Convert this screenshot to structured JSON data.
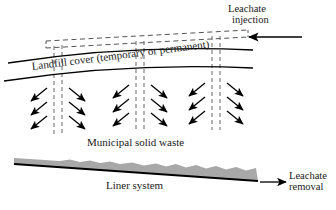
{
  "figure": {
    "type": "engineering-schematic",
    "background_color": "#ffffff",
    "line_color": "#000000",
    "waste_fill_color": "#a8a8a8"
  },
  "labels": {
    "leachate_injection_line1": "Leachate",
    "leachate_injection_line2": "injection",
    "landfill_cover": "Landfill cover  (temporary or permanent)",
    "municipal_solid_waste": "Municipal solid waste",
    "liner_system": "Liner system",
    "leachate_removal_line1": "Leachate",
    "leachate_removal_line2": "removal"
  },
  "elements": {
    "injection_arrow": {
      "name": "leachate-injection-arrow",
      "direction": "left",
      "x_start": 302,
      "x_end": 246,
      "y": 37
    },
    "removal_arrow": {
      "name": "leachate-removal-arrow",
      "direction": "right",
      "x_start": 258,
      "x_end": 288,
      "y": 182
    },
    "cover_upper_curve": {
      "name": "landfill-cover-upper-line",
      "left_point": [
        8,
        63
      ],
      "right_point": [
        253,
        50
      ]
    },
    "cover_lower_curve": {
      "name": "landfill-cover-lower-line",
      "left_point": [
        4,
        80
      ],
      "right_point": [
        253,
        68
      ]
    },
    "liner": {
      "name": "liner-system-wedge",
      "left_x": 14,
      "right_x": 258,
      "top_left_y": 158,
      "bottom_left_y": 164,
      "top_right_y": 168,
      "bottom_right_y": 180,
      "wavy_top_right": true
    },
    "header_pipe": {
      "name": "leachate-header-pipe",
      "style": "dashed",
      "lines": 2,
      "left_x": 46,
      "right_x": 248,
      "left_y_upper": 41,
      "left_y_lower": 48,
      "right_y_upper": 30,
      "right_y_lower": 37
    },
    "well_groups": [
      {
        "name": "injection-well-group-1",
        "dashed_line_x": [
          54,
          62
        ],
        "top_y": 41,
        "bottom_y": 134,
        "arrow_rows": 3
      },
      {
        "name": "injection-well-group-2",
        "dashed_line_x": [
          136,
          144
        ],
        "top_y": 37,
        "bottom_y": 132,
        "arrow_rows": 3
      },
      {
        "name": "injection-well-group-3",
        "dashed_line_x": [
          212,
          220
        ],
        "top_y": 33,
        "bottom_y": 130,
        "arrow_rows": 3
      }
    ],
    "arrow_rows_y": [
      96,
      110,
      124
    ],
    "arrow_length": 22,
    "arrow_angle_deg": 38
  }
}
